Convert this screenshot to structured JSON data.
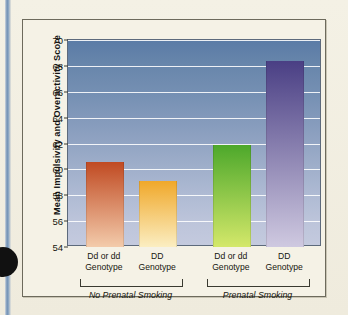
{
  "chart_data": {
    "type": "bar",
    "title": "",
    "xlabel": "",
    "ylabel": "Mean Impulsivity and Overactivity Score",
    "ylim": [
      54,
      70
    ],
    "yticks": [
      54,
      56,
      58,
      60,
      62,
      64,
      66,
      68,
      70
    ],
    "grid": true,
    "legend": "none",
    "categories": [
      "Dd or dd Genotype",
      "DD Genotype",
      "Dd or dd Genotype",
      "DD Genotype"
    ],
    "groups": [
      {
        "label": "No Prenatal Smoking",
        "bars": [
          0,
          1
        ]
      },
      {
        "label": "Prenatal Smoking",
        "bars": [
          2,
          3
        ]
      }
    ],
    "bars": [
      {
        "label_line1": "Dd or dd",
        "label_line2": "Genotype",
        "group": "No Prenatal Smoking",
        "value": 60.6,
        "color_top": "#c04a22",
        "color_bottom": "#f3cbab"
      },
      {
        "label_line1": "DD",
        "label_line2": "Genotype",
        "group": "No Prenatal Smoking",
        "value": 59.1,
        "color_top": "#f0a82a",
        "color_bottom": "#fbeec2"
      },
      {
        "label_line1": "Dd or dd",
        "label_line2": "Genotype",
        "group": "Prenatal Smoking",
        "value": 61.9,
        "color_top": "#4da82b",
        "color_bottom": "#d4e86a"
      },
      {
        "label_line1": "DD",
        "label_line2": "Genotype",
        "group": "Prenatal Smoking",
        "value": 68.35,
        "color_top": "#4a3f84",
        "color_bottom": "#cfc9e0"
      }
    ],
    "values": [
      60.6,
      59.1,
      61.9,
      68.35
    ],
    "plot_background_top": "#5a7ba6",
    "plot_background_bottom": "#c4cade",
    "page_background": "#f2efe2"
  }
}
